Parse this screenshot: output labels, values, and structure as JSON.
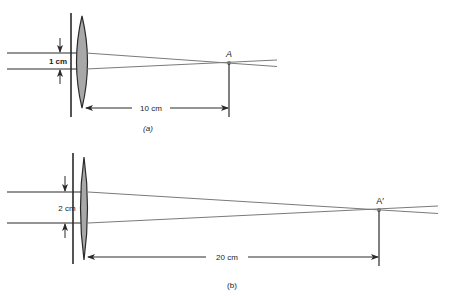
{
  "figure_a": {
    "beam_width_label": "1 cm",
    "focal_distance_label": "10 cm",
    "focal_point_label": "A",
    "caption": "(a)"
  },
  "figure_b": {
    "beam_width_label": "2 cm",
    "focal_distance_label": "20 cm",
    "focal_point_label": "A′",
    "caption": "(b)"
  },
  "colors": {
    "line": "#2a2a2a",
    "ray": "#7a7a7a",
    "lens_fill": "#a8a8a8",
    "background": "#ffffff"
  }
}
